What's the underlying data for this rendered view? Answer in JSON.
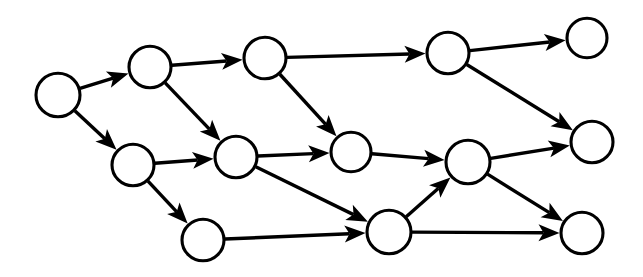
{
  "diagram": {
    "type": "node-link-diagram",
    "style": "scanned-line-art",
    "colors": {
      "background": "#ffffff",
      "node_fill": "#ffffff",
      "node_stroke": "#000000",
      "edge": "#000000"
    },
    "canvas": {
      "width": 643,
      "height": 277
    },
    "node_count": 12,
    "edge_count": 16,
    "nodes": [
      {
        "id": "n1",
        "label": "",
        "cx": 58,
        "cy": 95,
        "r": 22,
        "row": "left",
        "name": "node-1"
      },
      {
        "id": "n2",
        "label": "",
        "cx": 150,
        "cy": 67,
        "r": 21,
        "row": "top",
        "name": "node-2"
      },
      {
        "id": "n3",
        "label": "",
        "cx": 265,
        "cy": 58,
        "r": 21,
        "row": "top",
        "name": "node-3"
      },
      {
        "id": "n4",
        "label": "",
        "cx": 448,
        "cy": 53,
        "r": 21,
        "row": "top",
        "name": "node-4"
      },
      {
        "id": "n5",
        "label": "",
        "cx": 587,
        "cy": 38,
        "r": 20,
        "row": "top",
        "name": "node-5"
      },
      {
        "id": "n6",
        "label": "",
        "cx": 133,
        "cy": 165,
        "r": 21,
        "row": "middle",
        "name": "node-6"
      },
      {
        "id": "n7",
        "label": "",
        "cx": 236,
        "cy": 157,
        "r": 21,
        "row": "middle",
        "name": "node-7"
      },
      {
        "id": "n8",
        "label": "",
        "cx": 351,
        "cy": 152,
        "r": 20,
        "row": "middle",
        "name": "node-8"
      },
      {
        "id": "n9",
        "label": "",
        "cx": 468,
        "cy": 162,
        "r": 22,
        "row": "middle",
        "name": "node-9"
      },
      {
        "id": "n10",
        "label": "",
        "cx": 592,
        "cy": 142,
        "r": 21,
        "row": "middle",
        "name": "node-10"
      },
      {
        "id": "n11",
        "label": "",
        "cx": 203,
        "cy": 240,
        "r": 21,
        "row": "bottom",
        "name": "node-11"
      },
      {
        "id": "n12",
        "label": "",
        "cx": 389,
        "cy": 232,
        "r": 22,
        "row": "bottom",
        "name": "node-12"
      },
      {
        "id": "n13",
        "label": "",
        "cx": 582,
        "cy": 233,
        "r": 21,
        "row": "bottom",
        "name": "node-13"
      }
    ],
    "edges": [
      {
        "id": "e1",
        "from": "n1",
        "to": "n2",
        "name": "edge-n1-n2"
      },
      {
        "id": "e2",
        "from": "n1",
        "to": "n6",
        "name": "edge-n1-n6"
      },
      {
        "id": "e3",
        "from": "n2",
        "to": "n3",
        "name": "edge-n2-n3"
      },
      {
        "id": "e4",
        "from": "n2",
        "to": "n7",
        "name": "edge-n2-n7"
      },
      {
        "id": "e5",
        "from": "n3",
        "to": "n4",
        "name": "edge-n3-n4"
      },
      {
        "id": "e6",
        "from": "n3",
        "to": "n8",
        "name": "edge-n3-n8"
      },
      {
        "id": "e7",
        "from": "n4",
        "to": "n5",
        "name": "edge-n4-n5"
      },
      {
        "id": "e8",
        "from": "n4",
        "to": "n10",
        "name": "edge-n4-n10"
      },
      {
        "id": "e9",
        "from": "n6",
        "to": "n7",
        "name": "edge-n6-n7"
      },
      {
        "id": "e10",
        "from": "n6",
        "to": "n11",
        "name": "edge-n6-n11"
      },
      {
        "id": "e11",
        "from": "n7",
        "to": "n8",
        "name": "edge-n7-n8"
      },
      {
        "id": "e12",
        "from": "n7",
        "to": "n12",
        "name": "edge-n7-n12"
      },
      {
        "id": "e13",
        "from": "n8",
        "to": "n9",
        "name": "edge-n8-n9"
      },
      {
        "id": "e14",
        "from": "n9",
        "to": "n10",
        "name": "edge-n9-n10"
      },
      {
        "id": "e15",
        "from": "n9",
        "to": "n13",
        "name": "edge-n9-n13"
      },
      {
        "id": "e16",
        "from": "n11",
        "to": "n12",
        "name": "edge-n11-n12"
      },
      {
        "id": "e17",
        "from": "n12",
        "to": "n9",
        "name": "edge-n12-n9"
      },
      {
        "id": "e18",
        "from": "n12",
        "to": "n13",
        "name": "edge-n12-n13"
      }
    ],
    "arrow": {
      "length": 21,
      "half_width": 8.5,
      "notch": 5
    }
  }
}
